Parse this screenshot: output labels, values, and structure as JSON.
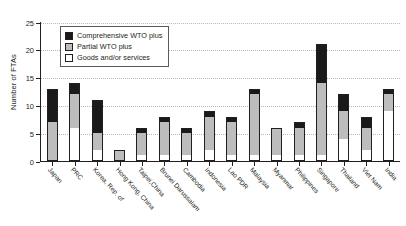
{
  "chart_data": {
    "type": "bar",
    "stacked": true,
    "title": "",
    "xlabel": "",
    "ylabel": "Number of FTAs",
    "ylim": [
      0,
      25
    ],
    "yticks": [
      0,
      5,
      10,
      15,
      20,
      25
    ],
    "grid": "horizontal-dotted",
    "legend_position": "top-left-inside",
    "categories": [
      "Japan",
      "PRC",
      "Korea, Rep. of",
      "Hong Kong, China",
      "Taipei,China",
      "Brunei Darussalam",
      "Cambodia",
      "Indonesia",
      "Lao PDR",
      "Malaysia",
      "Myanmar",
      "Philippines",
      "Singapore",
      "Thailand",
      "Viet Nam",
      "India"
    ],
    "series": [
      {
        "name": "Goods and/or services",
        "color": "#ffffff",
        "values": [
          0,
          6,
          2,
          0,
          1,
          1,
          1,
          2,
          1,
          1,
          1,
          1,
          1,
          4,
          2,
          9
        ]
      },
      {
        "name": "Partial WTO plus",
        "color": "#bdbdbd",
        "values": [
          7,
          6,
          3,
          2,
          4,
          6,
          4,
          6,
          6,
          11,
          5,
          5,
          13,
          5,
          4,
          3
        ]
      },
      {
        "name": "Comprehensive WTO plus",
        "color": "#1a1a1a",
        "values": [
          6,
          2,
          6,
          0,
          1,
          1,
          1,
          1,
          1,
          1,
          0,
          1,
          7,
          3,
          2,
          1
        ]
      }
    ],
    "totals": [
      13,
      14,
      11,
      2,
      6,
      8,
      6,
      9,
      8,
      13,
      6,
      7,
      21,
      12,
      8,
      13
    ]
  },
  "legend": {
    "items": [
      {
        "label": "Comprehensive WTO plus",
        "swatch": "comp"
      },
      {
        "label": "Partial WTO plus",
        "swatch": "part"
      },
      {
        "label": "Goods and/or services",
        "swatch": "goods"
      }
    ]
  },
  "axis": {
    "y_title": "Number of FTAs",
    "y_tick_labels": [
      "0",
      "5",
      "10",
      "15",
      "20",
      "25"
    ]
  }
}
